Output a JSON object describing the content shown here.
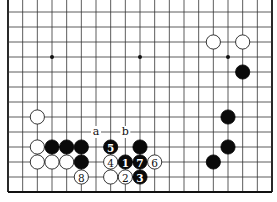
{
  "diagram": {
    "type": "go-board-partial",
    "board_columns": 19,
    "visible_rows": 13,
    "top_edge_open": true,
    "edges": [
      "left",
      "right",
      "bottom"
    ],
    "star_points": [
      {
        "col": 3,
        "row": 3
      },
      {
        "col": 9,
        "row": 3
      },
      {
        "col": 15,
        "row": 3
      }
    ],
    "stones": [
      {
        "color": "white",
        "col": 14,
        "row": 2,
        "label": ""
      },
      {
        "color": "white",
        "col": 16,
        "row": 2,
        "label": ""
      },
      {
        "color": "black",
        "col": 16,
        "row": 4,
        "label": ""
      },
      {
        "color": "black",
        "col": 15,
        "row": 7,
        "label": ""
      },
      {
        "color": "black",
        "col": 15,
        "row": 9,
        "label": ""
      },
      {
        "color": "black",
        "col": 14,
        "row": 10,
        "label": ""
      },
      {
        "color": "white",
        "col": 2,
        "row": 7,
        "label": ""
      },
      {
        "color": "white",
        "col": 2,
        "row": 9,
        "label": ""
      },
      {
        "color": "black",
        "col": 3,
        "row": 9,
        "label": ""
      },
      {
        "color": "black",
        "col": 4,
        "row": 9,
        "label": ""
      },
      {
        "color": "black",
        "col": 5,
        "row": 9,
        "label": ""
      },
      {
        "color": "white",
        "col": 2,
        "row": 10,
        "label": ""
      },
      {
        "color": "white",
        "col": 3,
        "row": 10,
        "label": ""
      },
      {
        "color": "white",
        "col": 4,
        "row": 10,
        "label": ""
      },
      {
        "color": "black",
        "col": 5,
        "row": 10,
        "label": ""
      },
      {
        "color": "white",
        "col": 5,
        "row": 11,
        "label": "8"
      },
      {
        "color": "black",
        "col": 7,
        "row": 9,
        "label": "5"
      },
      {
        "color": "black",
        "col": 9,
        "row": 9,
        "label": ""
      },
      {
        "color": "white",
        "col": 7,
        "row": 10,
        "label": "4"
      },
      {
        "color": "black",
        "col": 8,
        "row": 10,
        "label": "1"
      },
      {
        "color": "black",
        "col": 9,
        "row": 10,
        "label": "7"
      },
      {
        "color": "white",
        "col": 10,
        "row": 10,
        "label": "6"
      },
      {
        "color": "white",
        "col": 7,
        "row": 11,
        "label": ""
      },
      {
        "color": "white",
        "col": 8,
        "row": 11,
        "label": "2"
      },
      {
        "color": "black",
        "col": 9,
        "row": 11,
        "label": "3"
      }
    ],
    "markers": [
      {
        "text": "a",
        "col": 6,
        "row": 8
      },
      {
        "text": "b",
        "col": 8,
        "row": 8
      }
    ]
  }
}
